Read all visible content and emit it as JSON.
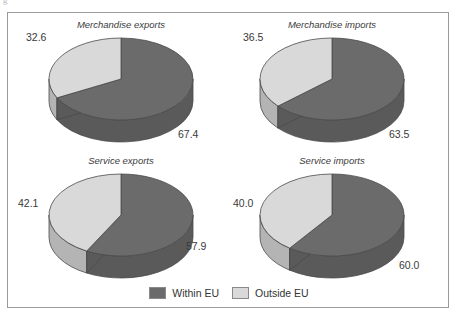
{
  "figure": {
    "corner_artifact": "g",
    "frame_color": "#9b9b9b",
    "background": "#ffffff"
  },
  "legend": {
    "position": "bottom-center",
    "entries": [
      {
        "label": "Within EU",
        "color": "#6b6b6b",
        "swatch_name": "legend-swatch-within-eu"
      },
      {
        "label": "Outside EU",
        "color": "#d9d9d9",
        "swatch_name": "legend-swatch-outside-eu"
      }
    ]
  },
  "colors": {
    "within_eu": "#6b6b6b",
    "outside_eu": "#d9d9d9",
    "within_eu_side": "#5a5a5a",
    "outside_eu_side": "#b4b4b4",
    "edge": "#4a4a4a",
    "text": "#3a3a3a"
  },
  "chart_data": {
    "type": "pie",
    "title": "",
    "subtitle": "",
    "legend_entries": [
      "Within EU",
      "Outside EU"
    ],
    "legend_position": "bottom-center",
    "categories": [
      "Within EU",
      "Outside EU"
    ],
    "units": "percent",
    "panels": [
      {
        "title": "Merchandise exports",
        "slices": [
          {
            "name": "Within EU",
            "value": 67.4,
            "label": "67.4"
          },
          {
            "name": "Outside EU",
            "value": 32.6,
            "label": "32.6"
          }
        ],
        "labels": {
          "within": "67.4",
          "outside": "32.6"
        }
      },
      {
        "title": "Merchandise imports",
        "slices": [
          {
            "name": "Within EU",
            "value": 63.5,
            "label": "63.5"
          },
          {
            "name": "Outside EU",
            "value": 36.5,
            "label": "36.5"
          }
        ],
        "labels": {
          "within": "63.5",
          "outside": "36.5"
        }
      },
      {
        "title": "Service exports",
        "slices": [
          {
            "name": "Within EU",
            "value": 57.9,
            "label": "57.9"
          },
          {
            "name": "Outside EU",
            "value": 42.1,
            "label": "42.1"
          }
        ],
        "labels": {
          "within": "57.9",
          "outside": "42.1"
        }
      },
      {
        "title": "Service imports",
        "slices": [
          {
            "name": "Within EU",
            "value": 60.0,
            "label": "60.0"
          },
          {
            "name": "Outside EU",
            "value": 40.0,
            "label": "40.0"
          }
        ],
        "labels": {
          "within": "60.0",
          "outside": "40.0"
        }
      }
    ]
  }
}
